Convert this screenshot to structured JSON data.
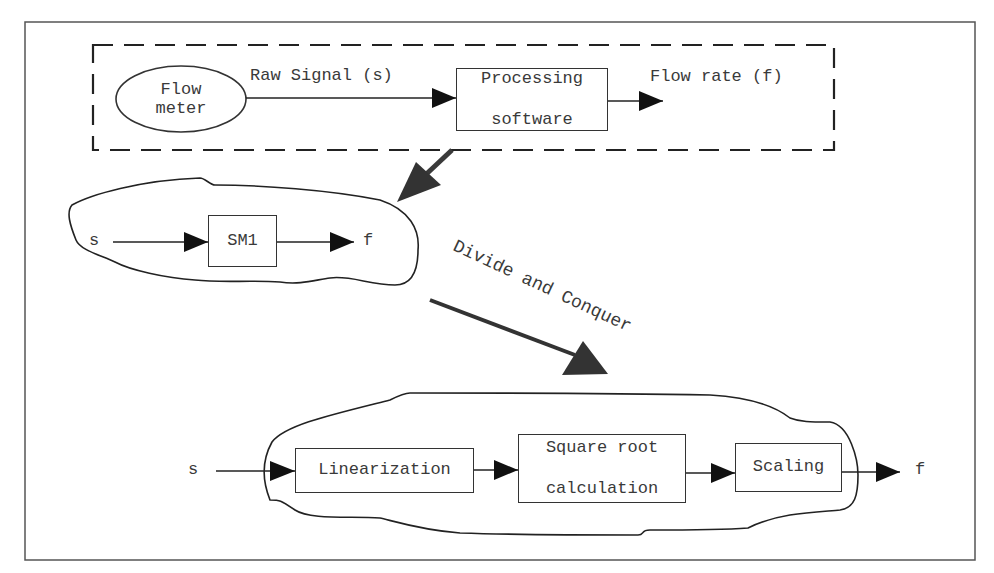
{
  "diagram": {
    "top_system": {
      "source": {
        "line1": "Flow",
        "line2": "meter"
      },
      "input_label": "Raw Signal (s)",
      "processor": {
        "line1": "Processing",
        "line2": "software"
      },
      "output_label": "Flow rate (f)"
    },
    "abstraction": {
      "input": "s",
      "block": "SM1",
      "output": "f"
    },
    "transition_label": "Divide and Conquer",
    "decomposition": {
      "input": "s",
      "blocks": [
        {
          "line1": "Linearization",
          "line2": ""
        },
        {
          "line1": "Square root",
          "line2": "calculation"
        },
        {
          "line1": "Scaling",
          "line2": ""
        }
      ],
      "output": "f"
    },
    "colors": {
      "stroke": "#333333",
      "thick_arrow": "#3a3a3a",
      "background": "#ffffff"
    }
  }
}
